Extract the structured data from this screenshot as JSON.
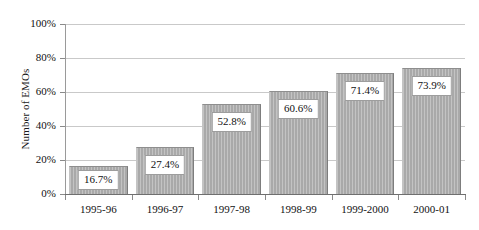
{
  "chart_data": {
    "type": "bar",
    "title": "",
    "subtitle": "",
    "xlabel": "",
    "ylabel": "Number of EMOs",
    "categories": [
      "1995-96",
      "1996-97",
      "1997-98",
      "1998-99",
      "1999-2000",
      "2000-01"
    ],
    "values": [
      16.7,
      27.4,
      52.8,
      60.6,
      71.4,
      73.9
    ],
    "value_labels": [
      "16.7%",
      "27.4%",
      "52.8%",
      "60.6%",
      "71.4%",
      "73.9%"
    ],
    "ylim": [
      0,
      100
    ],
    "ytick_values": [
      0,
      20,
      40,
      60,
      80,
      100
    ],
    "ytick_labels": [
      "0%",
      "20%",
      "40%",
      "60%",
      "80%",
      "100%"
    ],
    "grid": true,
    "grid_axis": "y",
    "legend": false,
    "legend_position": "none",
    "series": [
      {
        "name": "Number of EMOs",
        "values": [
          16.7,
          27.4,
          52.8,
          60.6,
          71.4,
          73.9
        ],
        "color": "#a9a9a9",
        "pattern": "vertical-stripes"
      }
    ],
    "colors": {
      "bar_fill": "#a9a9a9",
      "bar_border": "#8e8e8e",
      "gridline": "#c9c9c9",
      "axis": "#6f6f6f",
      "label_box_background": "#ffffff",
      "label_box_border": "#9d9d9d",
      "text": "#111111",
      "background": "#ffffff"
    }
  }
}
